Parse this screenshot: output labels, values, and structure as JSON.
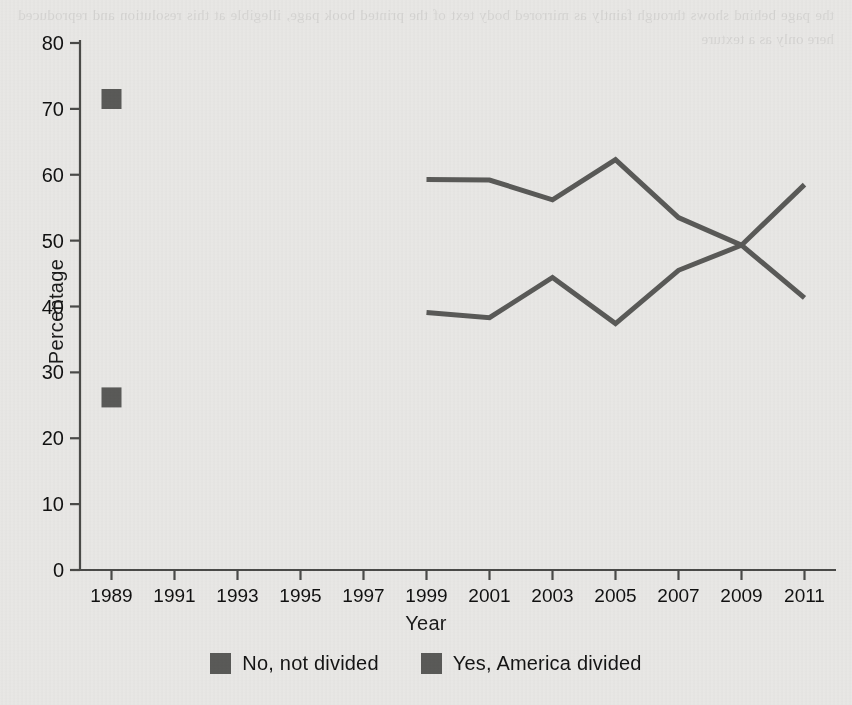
{
  "chart_data": {
    "type": "line",
    "title": "",
    "xlabel": "Year",
    "ylabel": "Percentage",
    "xlim": [
      1988,
      2012
    ],
    "ylim": [
      0,
      80
    ],
    "ytick_step": 10,
    "grid": false,
    "legend_position": "bottom-center",
    "xticks": [
      "1989",
      "1991",
      "1993",
      "1995",
      "1997",
      "1999",
      "2001",
      "2003",
      "2005",
      "2007",
      "2009",
      "2011"
    ],
    "yticks": [
      "0",
      "10",
      "20",
      "30",
      "40",
      "50",
      "60",
      "70",
      "80"
    ],
    "series": [
      {
        "name": "No, not divided",
        "color": "#5a5a58",
        "marker": "square",
        "points": [
          {
            "x": 1989,
            "y": 71.5,
            "style": "marker-only"
          },
          {
            "x": 1999,
            "y": 59.3
          },
          {
            "x": 2001,
            "y": 59.2
          },
          {
            "x": 2003,
            "y": 56.2
          },
          {
            "x": 2005,
            "y": 62.3
          },
          {
            "x": 2007,
            "y": 53.5
          },
          {
            "x": 2009,
            "y": 49.3
          },
          {
            "x": 2011,
            "y": 41.3
          }
        ]
      },
      {
        "name": "Yes, America divided",
        "color": "#5a5a58",
        "marker": "square",
        "points": [
          {
            "x": 1989,
            "y": 26.2,
            "style": "marker-only"
          },
          {
            "x": 1999,
            "y": 39.1
          },
          {
            "x": 2001,
            "y": 38.3
          },
          {
            "x": 2003,
            "y": 44.4
          },
          {
            "x": 2005,
            "y": 37.4
          },
          {
            "x": 2007,
            "y": 45.5
          },
          {
            "x": 2009,
            "y": 49.3
          },
          {
            "x": 2011,
            "y": 58.5
          }
        ]
      }
    ]
  },
  "legend": {
    "items": [
      {
        "label": "No, not divided",
        "color": "#5a5a58"
      },
      {
        "label": "Yes, America divided",
        "color": "#5a5a58"
      }
    ]
  },
  "axis": {
    "y_title": "Percentage",
    "x_title": "Year"
  },
  "background": {
    "page_color": "#e9e8e6",
    "ink_color": "#5a5a58"
  },
  "bleed_text": "the page behind shows through faintly as mirrored body text of the printed book page, illegible at this resolution and reproduced here only as a texture"
}
